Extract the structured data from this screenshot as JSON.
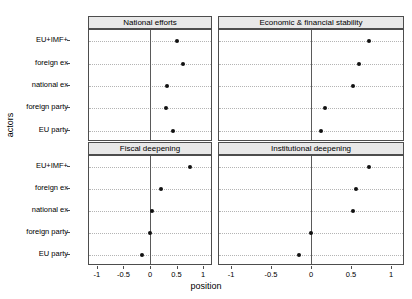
{
  "chart_data": {
    "type": "scatter",
    "title": "",
    "xlabel": "position",
    "ylabel": "actors",
    "xlim": [
      -1.15,
      1.15
    ],
    "xticks": [
      -1,
      -0.5,
      0,
      0.5,
      1
    ],
    "xticklabels": [
      "-1",
      "-0.5",
      "0",
      "0.5",
      "1"
    ],
    "categories": [
      "EU+IMF+",
      "foreign ex",
      "national ex",
      "foreign party",
      "EU party"
    ],
    "grid": "horizontal dotted gridlines at each category; solid vertical reference line at x = 0",
    "legend": "none",
    "facet_layout": "2 x 2 panels with gray strip headers",
    "panels": [
      {
        "label": "National efforts",
        "row": 0,
        "col": 0,
        "values": [
          0.5,
          0.63,
          0.32,
          0.31,
          0.44
        ]
      },
      {
        "label": "Economic & financial stability",
        "row": 0,
        "col": 1,
        "values": [
          0.72,
          0.6,
          0.52,
          0.17,
          0.12
        ]
      },
      {
        "label": "Fiscal deepening",
        "row": 1,
        "col": 0,
        "values": [
          0.75,
          0.2,
          0.03,
          0.0,
          -0.15
        ]
      },
      {
        "label": "Institutional deepening",
        "row": 1,
        "col": 1,
        "values": [
          0.72,
          0.56,
          0.52,
          0.0,
          -0.15
        ]
      }
    ],
    "series": [
      {
        "name": "National efforts",
        "values": [
          0.5,
          0.63,
          0.32,
          0.31,
          0.44
        ]
      },
      {
        "name": "Economic & financial stability",
        "values": [
          0.72,
          0.6,
          0.52,
          0.17,
          0.12
        ]
      },
      {
        "name": "Fiscal deepening",
        "values": [
          0.75,
          0.2,
          0.03,
          0.0,
          -0.15
        ]
      },
      {
        "name": "Institutional deepening",
        "values": [
          0.72,
          0.56,
          0.52,
          0.0,
          -0.15
        ]
      }
    ],
    "point_color": "#111111",
    "zero_line_color": "#5a5a5a",
    "strip_fill": "#e8e8e8",
    "grid_color": "#b4b4b4"
  }
}
